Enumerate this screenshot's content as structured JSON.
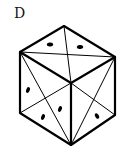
{
  "figure": {
    "label": "D",
    "stroke_color": "#000000",
    "background": "#ffffff",
    "faces": {
      "top": {
        "dots": 2
      },
      "left": {
        "dots": 3
      },
      "right": {
        "dots": 1
      }
    }
  }
}
